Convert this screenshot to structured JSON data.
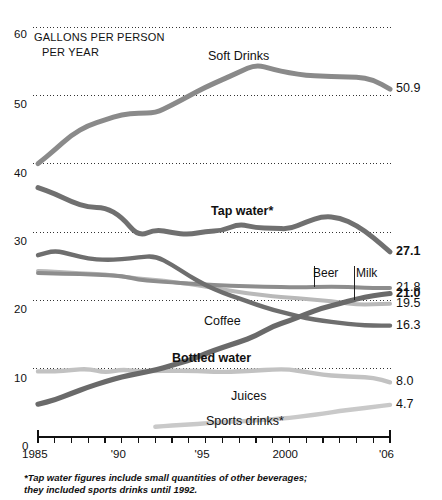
{
  "chart_data": {
    "type": "line",
    "title": "",
    "subtitle": "",
    "axis_caption_line1": "GALLONS PER PERSON",
    "axis_caption_line2": "PER YEAR",
    "xlabel": "",
    "ylabel": "GALLONS PER PERSON PER YEAR",
    "grid": true,
    "legend_position": "inline-labels",
    "xlim": [
      1985,
      2006
    ],
    "ylim": [
      0,
      60
    ],
    "yticks": [
      0,
      10,
      20,
      30,
      40,
      50,
      60
    ],
    "ytick_labels": [
      "0",
      "10",
      "20",
      "30",
      "40",
      "50",
      "60"
    ],
    "xticks": [
      1985,
      1990,
      1995,
      2000,
      2006
    ],
    "xtick_labels": [
      "1985",
      "'90",
      "'95",
      "2000",
      "'06"
    ],
    "x": [
      1985,
      1986,
      1987,
      1988,
      1989,
      1990,
      1991,
      1992,
      1993,
      1994,
      1995,
      1996,
      1997,
      1998,
      1999,
      2000,
      2001,
      2002,
      2003,
      2004,
      2005,
      2006
    ],
    "series": [
      {
        "name": "Soft Drinks",
        "label": "Soft Drinks",
        "label_bold": false,
        "color": "#8a8a8a",
        "width": 5.0,
        "end_value": "50.9",
        "end_value_bold": false,
        "values": [
          40.0,
          42.0,
          44.2,
          45.6,
          46.4,
          47.2,
          47.4,
          47.4,
          48.6,
          49.9,
          51.2,
          52.3,
          53.4,
          54.5,
          53.8,
          53.3,
          52.9,
          52.8,
          52.7,
          52.7,
          52.3,
          50.9
        ]
      },
      {
        "name": "Tap water",
        "label": "Tap water*",
        "label_bold": true,
        "color": "#707070",
        "width": 5.0,
        "end_value": "27.1",
        "end_value_bold": true,
        "values": [
          36.5,
          35.6,
          34.4,
          33.6,
          33.6,
          32.2,
          29.3,
          30.4,
          29.9,
          29.6,
          30.1,
          30.2,
          31.2,
          30.6,
          30.6,
          30.4,
          31.5,
          32.3,
          32.1,
          31.0,
          29.2,
          27.1
        ]
      },
      {
        "name": "Coffee",
        "label": "Coffee",
        "label_bold": false,
        "color": "#6e6e6e",
        "width": 4.4,
        "end_value": "16.3",
        "end_value_bold": false,
        "values": [
          26.6,
          27.3,
          26.7,
          26.1,
          25.9,
          26.0,
          26.3,
          26.5,
          25.2,
          23.6,
          22.2,
          21.1,
          20.3,
          19.4,
          18.6,
          18.0,
          17.4,
          17.0,
          16.7,
          16.4,
          16.3,
          16.3
        ]
      },
      {
        "name": "Beer",
        "label": "Beer",
        "label_bold": false,
        "color": "#8d8d8d",
        "width": 4.0,
        "end_value": "21.8",
        "end_value_bold": false,
        "values": [
          24.0,
          23.9,
          23.9,
          23.8,
          23.7,
          23.6,
          23.0,
          22.8,
          22.6,
          22.5,
          22.3,
          22.2,
          22.1,
          22.0,
          22.0,
          21.9,
          21.9,
          22.0,
          22.0,
          21.9,
          21.8,
          21.8
        ]
      },
      {
        "name": "Milk",
        "label": "Milk",
        "label_bold": false,
        "color": "#b9b9b9",
        "width": 4.0,
        "end_value": "19.5",
        "end_value_bold": false,
        "values": [
          24.3,
          24.2,
          24.0,
          23.9,
          23.8,
          23.5,
          23.2,
          23.0,
          22.7,
          22.4,
          22.0,
          21.6,
          21.2,
          20.9,
          20.6,
          20.4,
          20.2,
          20.0,
          19.7,
          19.4,
          19.4,
          19.5
        ]
      },
      {
        "name": "Bottled water",
        "label": "Bottled water",
        "label_bold": true,
        "color": "#6a6a6a",
        "width": 5.2,
        "end_value": "21.0",
        "end_value_bold": true,
        "values": [
          4.8,
          5.4,
          6.4,
          7.3,
          8.1,
          8.8,
          9.3,
          9.8,
          10.5,
          11.2,
          12.2,
          13.1,
          13.9,
          14.8,
          16.2,
          17.0,
          18.0,
          18.9,
          19.5,
          20.2,
          20.7,
          21.0
        ]
      },
      {
        "name": "Juices",
        "label": "Juices",
        "label_bold": false,
        "color": "#c2c2c2",
        "width": 4.4,
        "end_value": "8.0",
        "end_value_bold": false,
        "values": [
          9.6,
          9.6,
          9.8,
          10.0,
          9.4,
          9.9,
          9.6,
          9.7,
          9.7,
          9.7,
          9.6,
          9.5,
          9.6,
          9.7,
          9.9,
          9.9,
          9.5,
          9.1,
          8.9,
          8.8,
          8.7,
          8.0
        ]
      },
      {
        "name": "Sports drinks",
        "label": "Sports drinks*",
        "label_bold": false,
        "color": "#c9c9c9",
        "width": 4.4,
        "start_year": 1992,
        "end_value": "4.7",
        "end_value_bold": false,
        "values": [
          null,
          null,
          null,
          null,
          null,
          null,
          null,
          1.5,
          1.7,
          1.8,
          2.0,
          2.2,
          2.3,
          2.4,
          2.6,
          2.8,
          3.1,
          3.4,
          3.8,
          4.1,
          4.4,
          4.7
        ]
      }
    ],
    "annotations": [
      {
        "name": "beer-callout",
        "text": "Beer",
        "year": 2001.5
      },
      {
        "name": "milk-callout",
        "text": "Milk",
        "year": 2003.9
      }
    ],
    "footnote": "*Tap water figures include small quantities of other beverages; they included sports drinks until 1992."
  },
  "colors": {
    "background": "#ffffff",
    "text": "#111111",
    "grid": "#333333",
    "axis": "#111111"
  }
}
